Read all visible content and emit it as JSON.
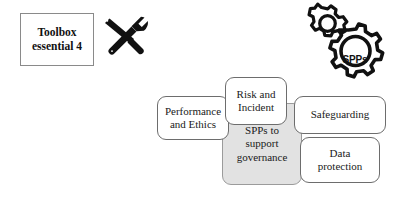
{
  "toolbox": {
    "line1": "Toolbox",
    "line2": "essential 4",
    "icon": "wrench-screwdriver-icon"
  },
  "gears": {
    "label": "SPPs",
    "icon": "gears-icon",
    "small_gear": "gear-small-icon",
    "large_gear": "gear-large-icon"
  },
  "diagram": {
    "center": {
      "line1": "SPPs to",
      "line2": "support",
      "line3": "governance",
      "fill": "#e2e2e2"
    },
    "nodes": [
      {
        "id": "performance",
        "line1": "Performance",
        "line2": "and Ethics"
      },
      {
        "id": "risk",
        "line1": "Risk and",
        "line2": "Incident"
      },
      {
        "id": "safeguarding",
        "line1": "Safeguarding",
        "line2": ""
      },
      {
        "id": "data",
        "line1": "Data",
        "line2": "protection"
      }
    ]
  },
  "colors": {
    "background": "#ffffff",
    "box_border": "#6d6d6d",
    "toolbox_border": "#8a8a8a",
    "center_fill": "#e2e2e2",
    "text": "#1a1a1a",
    "icon": "#111111"
  }
}
